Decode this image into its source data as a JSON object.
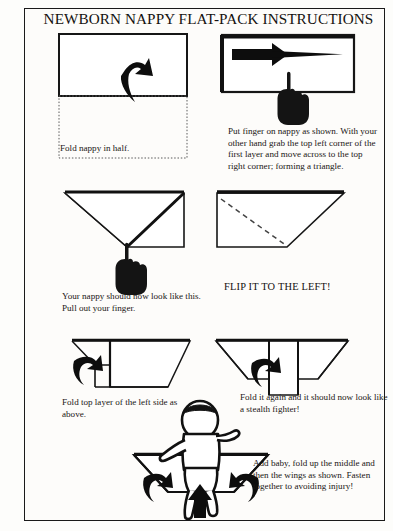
{
  "document": {
    "title": "NEWBORN NAPPY FLAT-PACK INSTRUCTIONS",
    "type": "instructional-diagram",
    "border_color": "#1a1a1a",
    "ink_color": "#111111",
    "paper_color": "#fdfcfa"
  },
  "steps": [
    {
      "id": "step-1",
      "caption": "Fold nappy in half.",
      "figure": "rectangle-with-dotted-lower-half-and-fold-up-arrow"
    },
    {
      "id": "step-2",
      "caption": "Put finger on nappy as shown. With your other hand grab the top left corner of the  first layer and move across to the top right corner; forming a triangle.",
      "figure": "rectangle-with-right-pointing-tapered-arrow-and-pointing-hand"
    },
    {
      "id": "step-3",
      "caption": "Your nappy should now look like this. Pull out your finger.",
      "figure": "triangle-with-right-rectangle-and-pointing-hand"
    },
    {
      "id": "step-4",
      "caption": "FLIP IT TO THE LEFT!",
      "figure": "quadrilateral-with-dashed-diagonal-fold-line",
      "emphasis": true
    },
    {
      "id": "step-5",
      "caption": "Fold top layer of the left side as above.",
      "figure": "notched-shape-with-left-curved-arrow"
    },
    {
      "id": "step-6",
      "caption": "Fold it again and it should now look like a stealth fighter!",
      "figure": "stealth-fighter-shape-with-curved-arrow"
    },
    {
      "id": "step-7",
      "caption": "Add baby, fold up the middle and then the wings as shown. Fasten together to avoiding injury!",
      "figure": "baby-on-nappy-with-three-fold-arrows"
    }
  ]
}
